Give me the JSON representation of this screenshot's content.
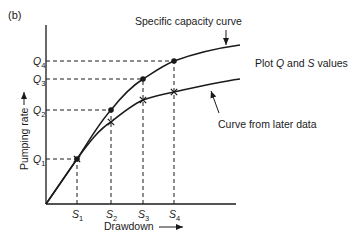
{
  "panel_label": "(b)",
  "axes": {
    "x_label": "Drawdown",
    "y_label": "Pumping rate",
    "x_ticks": [
      {
        "base": "S",
        "sub": "1"
      },
      {
        "base": "S",
        "sub": "2"
      },
      {
        "base": "S",
        "sub": "3"
      },
      {
        "base": "S",
        "sub": "4"
      }
    ],
    "y_ticks": [
      {
        "base": "Q",
        "sub": "1"
      },
      {
        "base": "Q",
        "sub": "2"
      },
      {
        "base": "Q",
        "sub": "3"
      },
      {
        "base": "Q",
        "sub": "4"
      }
    ]
  },
  "curves": {
    "specific_capacity": {
      "label": "Specific capacity curve",
      "marker": "dot"
    },
    "later_data": {
      "label": "Curve from later data",
      "marker": "cross"
    }
  },
  "annotation": {
    "prefix": "Plot ",
    "q": "Q",
    "mid": " and ",
    "s": "S",
    "suffix": " values"
  },
  "colors": {
    "ink": "#1a1a1a",
    "background": "#ffffff"
  }
}
